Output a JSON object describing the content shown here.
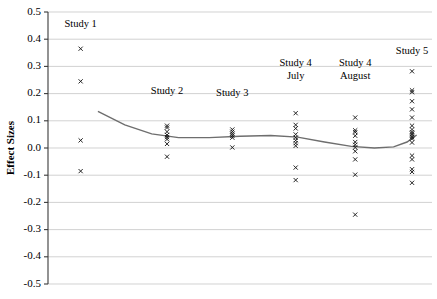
{
  "chart_data": {
    "type": "scatter",
    "title": "",
    "xlabel": "",
    "ylabel": "Effect Sizes",
    "ylim": [
      -0.5,
      0.5
    ],
    "ytick_labels": [
      "0.5",
      "0.4",
      "0.3",
      "0.2",
      "0.1",
      "0.0",
      "-0.1",
      "-0.2",
      "-0.3",
      "-0.4",
      "-0.5"
    ],
    "ytick_values": [
      0.5,
      0.4,
      0.3,
      0.2,
      0.1,
      0.0,
      -0.1,
      -0.2,
      -0.3,
      -0.4,
      -0.5
    ],
    "grid": true,
    "legend": "none",
    "xaxis_visible": false,
    "annotations": [
      {
        "text": "Study 1",
        "x": 0.085,
        "y": 0.445
      },
      {
        "text": "Study 2",
        "x": 0.31,
        "y": 0.2
      },
      {
        "text": "Study 3",
        "x": 0.48,
        "y": 0.19
      },
      {
        "text": "Study 4",
        "x": 0.645,
        "y": 0.3
      },
      {
        "text": "July",
        "x": 0.645,
        "y": 0.252
      },
      {
        "text": "Study 4",
        "x": 0.8,
        "y": 0.3
      },
      {
        "text": "August",
        "x": 0.8,
        "y": 0.252
      },
      {
        "text": "Study 5",
        "x": 0.948,
        "y": 0.345
      }
    ],
    "series": [
      {
        "name": "Study 1",
        "x": 0.085,
        "values": [
          0.365,
          0.245,
          0.028,
          -0.085
        ]
      },
      {
        "name": "Study 2",
        "x": 0.31,
        "values": [
          0.082,
          0.075,
          0.06,
          0.048,
          0.04,
          0.032,
          0.015,
          -0.032
        ]
      },
      {
        "name": "Study 3",
        "x": 0.48,
        "values": [
          0.068,
          0.06,
          0.052,
          0.045,
          0.038,
          0.002
        ]
      },
      {
        "name": "Study 4 July",
        "x": 0.645,
        "values": [
          0.128,
          0.085,
          0.072,
          0.05,
          0.038,
          0.028,
          0.018,
          0.008,
          -0.072,
          -0.118
        ]
      },
      {
        "name": "Study 4 August",
        "x": 0.8,
        "values": [
          0.112,
          0.065,
          0.058,
          0.045,
          0.022,
          0.012,
          0.002,
          -0.012,
          -0.042,
          -0.098,
          -0.245
        ]
      },
      {
        "name": "Study 5",
        "x": 0.948,
        "values": [
          0.282,
          0.212,
          0.205,
          0.172,
          0.142,
          0.112,
          0.082,
          0.068,
          0.058,
          0.052,
          0.046,
          0.04,
          0.034,
          0.02,
          -0.028,
          -0.042,
          -0.078,
          -0.088,
          -0.128
        ]
      }
    ],
    "trend": {
      "name": "fitted-trend-line",
      "points": [
        {
          "x": 0.13,
          "y": 0.135
        },
        {
          "x": 0.2,
          "y": 0.085
        },
        {
          "x": 0.27,
          "y": 0.052
        },
        {
          "x": 0.34,
          "y": 0.038
        },
        {
          "x": 0.42,
          "y": 0.038
        },
        {
          "x": 0.5,
          "y": 0.043
        },
        {
          "x": 0.58,
          "y": 0.046
        },
        {
          "x": 0.65,
          "y": 0.04
        },
        {
          "x": 0.72,
          "y": 0.022
        },
        {
          "x": 0.79,
          "y": 0.006
        },
        {
          "x": 0.85,
          "y": 0.0
        },
        {
          "x": 0.9,
          "y": 0.004
        },
        {
          "x": 0.935,
          "y": 0.022
        },
        {
          "x": 0.96,
          "y": 0.048
        }
      ]
    }
  }
}
